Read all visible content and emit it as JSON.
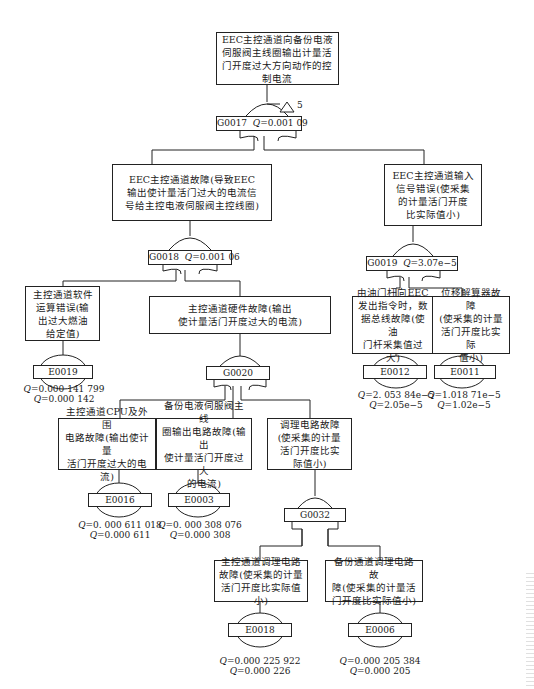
{
  "diagram": {
    "type": "fault-tree",
    "top_event": {
      "id": "top",
      "text": "EEC主控通道向备份电液伺服阀主线圈输出计量活门开度过大方向动作的控制电流",
      "gate": "G0017",
      "gate_type": "OR",
      "q_label": "Q",
      "q_value": "=0.001 09",
      "transfer_number": "5"
    },
    "nodes": [
      {
        "id": "n1",
        "text": "EEC主控通道故障(导致EEC输出使计量活门过大的电流信号给主控电液伺服阀主控线圈)",
        "gate": "G0018",
        "gate_type": "OR",
        "q_value": "=0.001 06"
      },
      {
        "id": "n2",
        "text": "EEC主控通道输入信号错误(使采集的计量活门开度比实际值小)",
        "gate": "G0019",
        "gate_type": "OR",
        "q_value": "=3.07e−5"
      },
      {
        "id": "n3",
        "text": "主控通道软件运算错误(输出过大燃油给定值)",
        "event": "E0019",
        "q_detail": "=0.000 141 799",
        "q_round": "=0.000 142"
      },
      {
        "id": "n4",
        "text": "主控通道硬件故障(输出使计量活门开度过大的电流)",
        "gate": "G0020",
        "gate_type": "OR"
      },
      {
        "id": "n5",
        "text": "由油门杆向EEC发出指令时，数据总线故障(使油门杆采集值过大)",
        "event": "E0012",
        "q_detail": "=2. 053 84e−5",
        "q_round": "=2.05e−5"
      },
      {
        "id": "n6",
        "text": "位移解算器故障(使采集的计量活门开度比实际值小)",
        "event": "E0011",
        "q_detail": "=1.018 71e−5",
        "q_round": "=1.02e−5"
      },
      {
        "id": "n7",
        "text": "主控通道CPU及外围电路故障(输出使计量活门开度过大的电流)",
        "event": "E0016",
        "q_detail": "=0. 000 611 018",
        "q_round": "=0.000 611"
      },
      {
        "id": "n8",
        "text": "备份电液伺服阀主线圈输出电路故障(输出使计量活门开度过大的电流)",
        "event": "E0003",
        "q_detail": "=0. 000 308 076",
        "q_round": "=0.000 308"
      },
      {
        "id": "n9",
        "text": "调理电路故障(使采集的计量活门开度比实际值小)",
        "gate": "G0032",
        "gate_type": "OR"
      },
      {
        "id": "n10",
        "text": "主控通道调理电路故障(使采集的计量活门开度比实际值小)",
        "event": "E0018",
        "q_detail": "=0.000 225 922",
        "q_round": "=0.000 226"
      },
      {
        "id": "n11",
        "text": "备份通道调理电路故障(使采集的计量活门开度比实际值小)",
        "event": "E0006",
        "q_detail": "=0.000 205 384",
        "q_round": "=0.000 205"
      }
    ]
  },
  "boxes": {
    "top": [
      "EEC主控通道向备份电液",
      "伺服阀主线圈输出计量活",
      "门开度过大方向动作的控",
      "制电流"
    ],
    "n1": [
      "EEC主控通道故障(导致EEC",
      "输出使计量活门过大的电流信",
      "号给主控电液伺服阀主控线圈)"
    ],
    "n2": [
      "EEC主控通道输入",
      "信号错误(使采集",
      "的计量活门开度",
      "比实际值小)"
    ],
    "n3": [
      "主控通道软件",
      "运算错误(输",
      "出过大燃油",
      "给定值)"
    ],
    "n4": [
      "主控通道硬件故障(输出",
      "使计量活门开度过大的电流)"
    ],
    "n5": [
      "由油门杆向EEC",
      "发出指令时，数",
      "据总线故障(使油",
      "门杆采集值过大)"
    ],
    "n6": [
      "位移解算器故障",
      "(使采集的计量",
      "活门开度比实际",
      "值小)"
    ],
    "n7": [
      "主控通道CPU及外围",
      "电路故障(输出使计量",
      "活门开度过大的电流)"
    ],
    "n8": [
      "备份电液伺服阀主线",
      "圈输出电路故障(输出",
      "使计量活门开度过大",
      "的电流)"
    ],
    "n9": [
      "调理电路故障",
      "(使采集的计量",
      "活门开度比实",
      "际值小)"
    ],
    "n10": [
      "主控通道调理电路",
      "故障(使采集的计量",
      "活门开度比实际值小)"
    ],
    "n11": [
      "备份通道调理电路故",
      "障(使采集的计量活",
      "门开度比实际值小)"
    ]
  },
  "gates": {
    "g17": {
      "id": "G0017",
      "q": "=0.001 09"
    },
    "g18": {
      "id": "G0018",
      "q": "=0.001 06"
    },
    "g19": {
      "id": "G0019",
      "q": "=3.07e−5"
    },
    "g20": {
      "id": "G0020"
    },
    "g32": {
      "id": "G0032"
    }
  },
  "events": {
    "e19": {
      "id": "E0019",
      "q1": "=0.000 141 799",
      "q2": "=0.000 142"
    },
    "e12": {
      "id": "E0012",
      "q1": "=2. 053 84e−5",
      "q2": "=2.05e−5"
    },
    "e11": {
      "id": "E0011",
      "q1": "=1.018 71e−5",
      "q2": "=1.02e−5"
    },
    "e16": {
      "id": "E0016",
      "q1": "=0. 000 611 018",
      "q2": "=0.000 611"
    },
    "e03": {
      "id": "E0003",
      "q1": "=0. 000 308 076",
      "q2": "=0.000 308"
    },
    "e18": {
      "id": "E0018",
      "q1": "=0.000 225 922",
      "q2": "=0.000 226"
    },
    "e06": {
      "id": "E0006",
      "q1": "=0.000 205 384",
      "q2": "=0.000 205"
    }
  },
  "q_symbol": "Q",
  "transfer": "5"
}
